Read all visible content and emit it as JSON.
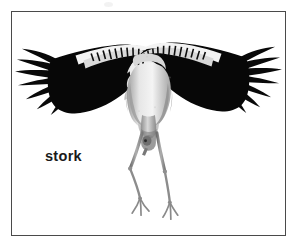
{
  "figure": {
    "kind": "labeled-photograph",
    "caption": "stork",
    "background_color": "#ffffff",
    "frame": {
      "border_color": "#4a4a4a",
      "border_width_px": 1,
      "x": 11,
      "y": 11,
      "width": 275,
      "height": 225
    },
    "label": {
      "text": "stork",
      "color": "#1a1a1a",
      "weight": "bold",
      "x": 44,
      "y": 150
    },
    "subject_colors": {
      "wing_black": "#0a0a0a",
      "wing_speckle_white": "#f2f2f2",
      "body_gray": "#b8b8b8",
      "body_highlight": "#e8e8e8",
      "leg_gray": "#8f8f8f",
      "beak_gray": "#7d7d7d"
    }
  }
}
